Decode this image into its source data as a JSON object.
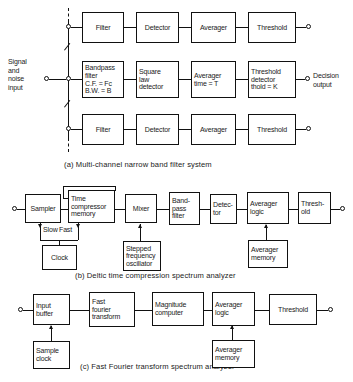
{
  "figure": {
    "line_color": "#111111",
    "background": "#ffffff"
  },
  "panel_a": {
    "caption": "(a)  Multi-channel narrow band filter system",
    "input_label": "Signal\nand\nnoise\ninput",
    "output_label": "Decision\noutput",
    "rows": [
      {
        "id": "row-top",
        "blocks": [
          {
            "name": "filter",
            "label": "Filter"
          },
          {
            "name": "detector",
            "label": "Detector"
          },
          {
            "name": "averager",
            "label": "Averager"
          },
          {
            "name": "threshold",
            "label": "Threshold"
          }
        ]
      },
      {
        "id": "row-middle",
        "blocks": [
          {
            "name": "bandpass-filter",
            "label": "Bandpass\nfilter\nC.F. = Fc\nB.W. = B"
          },
          {
            "name": "square-law-detector",
            "label": "Square\nlaw\ndetector"
          },
          {
            "name": "averager-time",
            "label": "Averager\ntime = T"
          },
          {
            "name": "threshold-detector",
            "label": "Threshold\ndetector\nthold = K"
          }
        ]
      },
      {
        "id": "row-bottom",
        "blocks": [
          {
            "name": "filter",
            "label": "Filter"
          },
          {
            "name": "detector",
            "label": "Detector"
          },
          {
            "name": "averager",
            "label": "Averager"
          },
          {
            "name": "threshold",
            "label": "Threshold"
          }
        ]
      }
    ]
  },
  "panel_b": {
    "caption": "(b)  Deltic time compression spectrum analyzer",
    "blocks": [
      {
        "name": "sampler",
        "label": "Sampler"
      },
      {
        "name": "time-compressor-memory",
        "label": "Time\ncompressor\nmemory"
      },
      {
        "name": "mixer",
        "label": "Mixer"
      },
      {
        "name": "bandpass-filter",
        "label": "Band-\npass\nfilter"
      },
      {
        "name": "detector",
        "label": "Detec-\ntor"
      },
      {
        "name": "averager-logic",
        "label": "Averager\nlogic"
      },
      {
        "name": "threshold",
        "label": "Thresh-\nold"
      },
      {
        "name": "clock",
        "label": "Clock"
      },
      {
        "name": "stepped-frequency-oscillator",
        "label": "Stepped\nfrequency\noscillator"
      },
      {
        "name": "averager-memory",
        "label": "Averager\nmemory"
      }
    ],
    "rate_labels": {
      "slow": "Slow",
      "fast": "Fast"
    }
  },
  "panel_c": {
    "caption": "(c)  Fast  Fourier  transform spectrum analyzer",
    "blocks": [
      {
        "name": "input-buffer",
        "label": "Input\nbuffer"
      },
      {
        "name": "fast-fourier-transform",
        "label": "Fast\nfourier\ntransform"
      },
      {
        "name": "magnitude-computer",
        "label": "Magnitude\ncomputer"
      },
      {
        "name": "averager-logic",
        "label": "Averager\nlogic"
      },
      {
        "name": "threshold",
        "label": "Threshold"
      },
      {
        "name": "sample-clock",
        "label": "Sample\nclock"
      },
      {
        "name": "averager-memory",
        "label": "Averager\nmemory"
      }
    ]
  }
}
